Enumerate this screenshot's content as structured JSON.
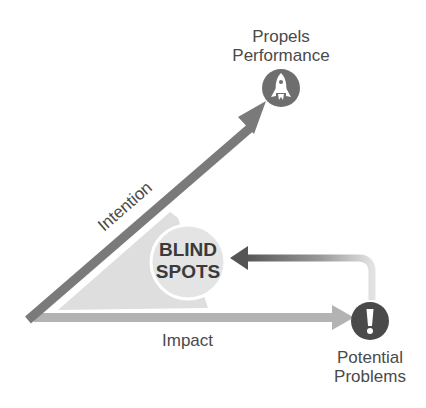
{
  "diagram": {
    "title": "",
    "nodes": {
      "top": {
        "line1": "Propels",
        "line2": "Performance",
        "icon": "rocket-icon"
      },
      "bottom": {
        "line1": "Potential",
        "line2": "Problems",
        "icon": "exclamation-icon"
      },
      "center": {
        "line1": "BLIND",
        "line2": "SPOTS"
      }
    },
    "edges": {
      "intention": "Intention",
      "impact": "Impact",
      "feedback": ""
    },
    "colors": {
      "intention_arrow": "#7a7a7a",
      "impact_arrow": "#b0b0b0",
      "shaded_area": "#dedede",
      "circle": "#e6e6e6",
      "icon_fill": "#6e6e6e",
      "problem_icon": "#4a4a4a"
    }
  }
}
